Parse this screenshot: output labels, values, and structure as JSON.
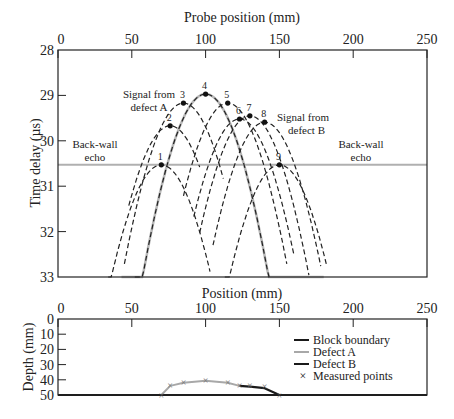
{
  "chart_data": [
    {
      "type": "line",
      "title": "",
      "xlabel": "Probe position (mm)",
      "ylabel": "Time delay (µs)",
      "xlim": [
        0,
        250
      ],
      "ylim": [
        33,
        28
      ],
      "x_ticks": [
        0,
        50,
        100,
        150,
        200,
        250
      ],
      "y_ticks": [
        28,
        29,
        30,
        31,
        32,
        33
      ],
      "y_inverted": true,
      "x_axis_position": "top",
      "grid": false,
      "back_wall_time": 30.53,
      "annotations": [
        {
          "text": "Signal from\ndefect A",
          "x": 78,
          "y": 29.1
        },
        {
          "text": "Signal from\ndefect B",
          "x": 166,
          "y": 29.6
        },
        {
          "text": "Back-wall\necho",
          "x": 18,
          "y": 30.2
        },
        {
          "text": "Back-wall\necho",
          "x": 200,
          "y": 30.2
        }
      ],
      "measured_points": [
        {
          "label": "1",
          "x": 70,
          "y": 30.53
        },
        {
          "label": "2",
          "x": 76,
          "y": 29.67
        },
        {
          "label": "3",
          "x": 85,
          "y": 29.17
        },
        {
          "label": "4",
          "x": 100,
          "y": 28.97
        },
        {
          "label": "5",
          "x": 115,
          "y": 29.17
        },
        {
          "label": "6",
          "x": 123,
          "y": 29.52
        },
        {
          "label": "7",
          "x": 130,
          "y": 29.45
        },
        {
          "label": "8",
          "x": 140,
          "y": 29.59
        },
        {
          "label": "9",
          "x": 150,
          "y": 30.53
        }
      ],
      "series": [
        {
          "name": "Back-wall echo",
          "style": "solid",
          "color": "#b0b0b0",
          "x": [
            0,
            250
          ],
          "y": [
            30.53,
            30.53
          ]
        },
        {
          "name": "Defect A envelope",
          "style": "solid",
          "color": "#b8b8b8",
          "apex_x": 100,
          "apex_y": 28.97,
          "x_range": [
            43,
            180
          ]
        },
        {
          "name": "Curve 1",
          "style": "dashed",
          "apex_x": 70,
          "apex_y": 30.53,
          "x_range": [
            34,
            103
          ]
        },
        {
          "name": "Curve 2",
          "style": "dashed",
          "apex_x": 76,
          "apex_y": 29.67,
          "x_range": [
            48,
            96
          ]
        },
        {
          "name": "Curve 3",
          "style": "dashed",
          "apex_x": 85,
          "apex_y": 29.17,
          "x_range": [
            45,
            112
          ]
        },
        {
          "name": "Curve 4",
          "style": "dashed",
          "apex_x": 100,
          "apex_y": 28.97,
          "x_range": [
            52,
            143
          ]
        },
        {
          "name": "Curve 5",
          "style": "dashed",
          "apex_x": 115,
          "apex_y": 29.17,
          "x_range": [
            85,
            155
          ]
        },
        {
          "name": "Curve 6",
          "style": "dashed",
          "apex_x": 123,
          "apex_y": 29.52,
          "x_range": [
            92,
            160
          ]
        },
        {
          "name": "Curve 7",
          "style": "dashed",
          "apex_x": 130,
          "apex_y": 29.45,
          "x_range": [
            96,
            170
          ]
        },
        {
          "name": "Curve 8",
          "style": "dashed",
          "apex_x": 140,
          "apex_y": 29.59,
          "x_range": [
            105,
            178
          ]
        },
        {
          "name": "Curve 9",
          "style": "dashed",
          "apex_x": 150,
          "apex_y": 30.53,
          "x_range": [
            113,
            182
          ]
        }
      ]
    },
    {
      "type": "line",
      "title": "",
      "xlabel": "Position (mm)",
      "ylabel": "Depth (mm)",
      "xlim": [
        0,
        250
      ],
      "ylim": [
        50,
        0
      ],
      "x_ticks": [
        0,
        50,
        100,
        150,
        200,
        250
      ],
      "y_ticks": [
        0,
        10,
        20,
        30,
        40,
        50
      ],
      "y_inverted": true,
      "x_axis_position": "top",
      "grid": false,
      "legend": {
        "position": "right",
        "entries": [
          {
            "label": "Block boundary",
            "style": "solid",
            "color": "#1a1a1a"
          },
          {
            "label": "Defect A",
            "style": "solid",
            "color": "#a8a8a8"
          },
          {
            "label": "Defect B",
            "style": "solid",
            "color": "#1a1a1a"
          },
          {
            "label": "Measured points",
            "style": "marker-x",
            "color": "#888888"
          }
        ]
      },
      "series": [
        {
          "name": "Block boundary",
          "x": [
            0,
            250
          ],
          "y": [
            50,
            50
          ]
        },
        {
          "name": "Defect A",
          "x": [
            70,
            76,
            85,
            100,
            115,
            123
          ],
          "y": [
            50,
            44,
            42,
            40.6,
            42,
            44
          ]
        },
        {
          "name": "Defect B",
          "x": [
            123,
            130,
            140,
            150
          ],
          "y": [
            44,
            44.5,
            45.5,
            50
          ]
        },
        {
          "name": "Measured points",
          "x": [
            70,
            76,
            85,
            100,
            115,
            123,
            130,
            140,
            150
          ],
          "y": [
            50,
            44,
            42,
            40.6,
            42,
            44,
            44,
            44.5,
            50
          ]
        }
      ]
    }
  ],
  "labels": {
    "top_xlabel": "Probe position (mm)",
    "top_ylabel": "Time delay (µs)",
    "bottom_xlabel": "Position (mm)",
    "bottom_ylabel": "Depth (mm)",
    "defect_a_signal_line1": "Signal from",
    "defect_a_signal_line2": "defect A",
    "defect_b_signal_line1": "Signal from",
    "defect_b_signal_line2": "defect B",
    "backwall_left_line1": "Back-wall",
    "backwall_left_line2": "echo",
    "backwall_right_line1": "Back-wall",
    "backwall_right_line2": "echo",
    "legend_block": "Block boundary",
    "legend_defect_a": "Defect A",
    "legend_defect_b": "Defect B",
    "legend_points": "Measured points"
  },
  "colors": {
    "axis": "#222222",
    "gray_line": "#b0b0b0",
    "dark_line": "#1a1a1a",
    "marker": "#888888"
  }
}
